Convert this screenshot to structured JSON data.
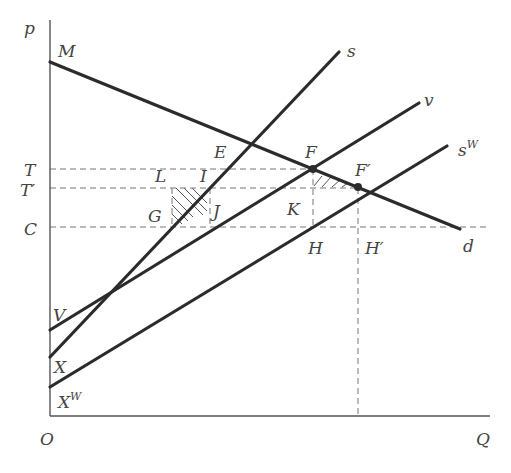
{
  "axes": {
    "y_label": "p",
    "x_label": "Q",
    "origin_label": "O"
  },
  "price_levels": {
    "T": "T",
    "T_prime": "T′",
    "C": "C"
  },
  "curves": {
    "demand": {
      "label": "d",
      "start_label": "M"
    },
    "supply": {
      "label": "s",
      "intercept_label": "X"
    },
    "v_curve": {
      "label": "v",
      "intercept_label": "V"
    },
    "world_supply": {
      "label": "s",
      "label_sup": "W",
      "intercept_label": "X",
      "intercept_sup": "W"
    }
  },
  "points": {
    "E": "E",
    "F": "F",
    "F_prime": "F′",
    "L": "L",
    "I": "I",
    "G": "G",
    "J": "J",
    "K": "K",
    "H": "H",
    "H_prime": "H′"
  },
  "colors": {
    "curve": "#2b2b2b",
    "axis": "#555555",
    "dash": "#777777",
    "label": "#444444"
  }
}
